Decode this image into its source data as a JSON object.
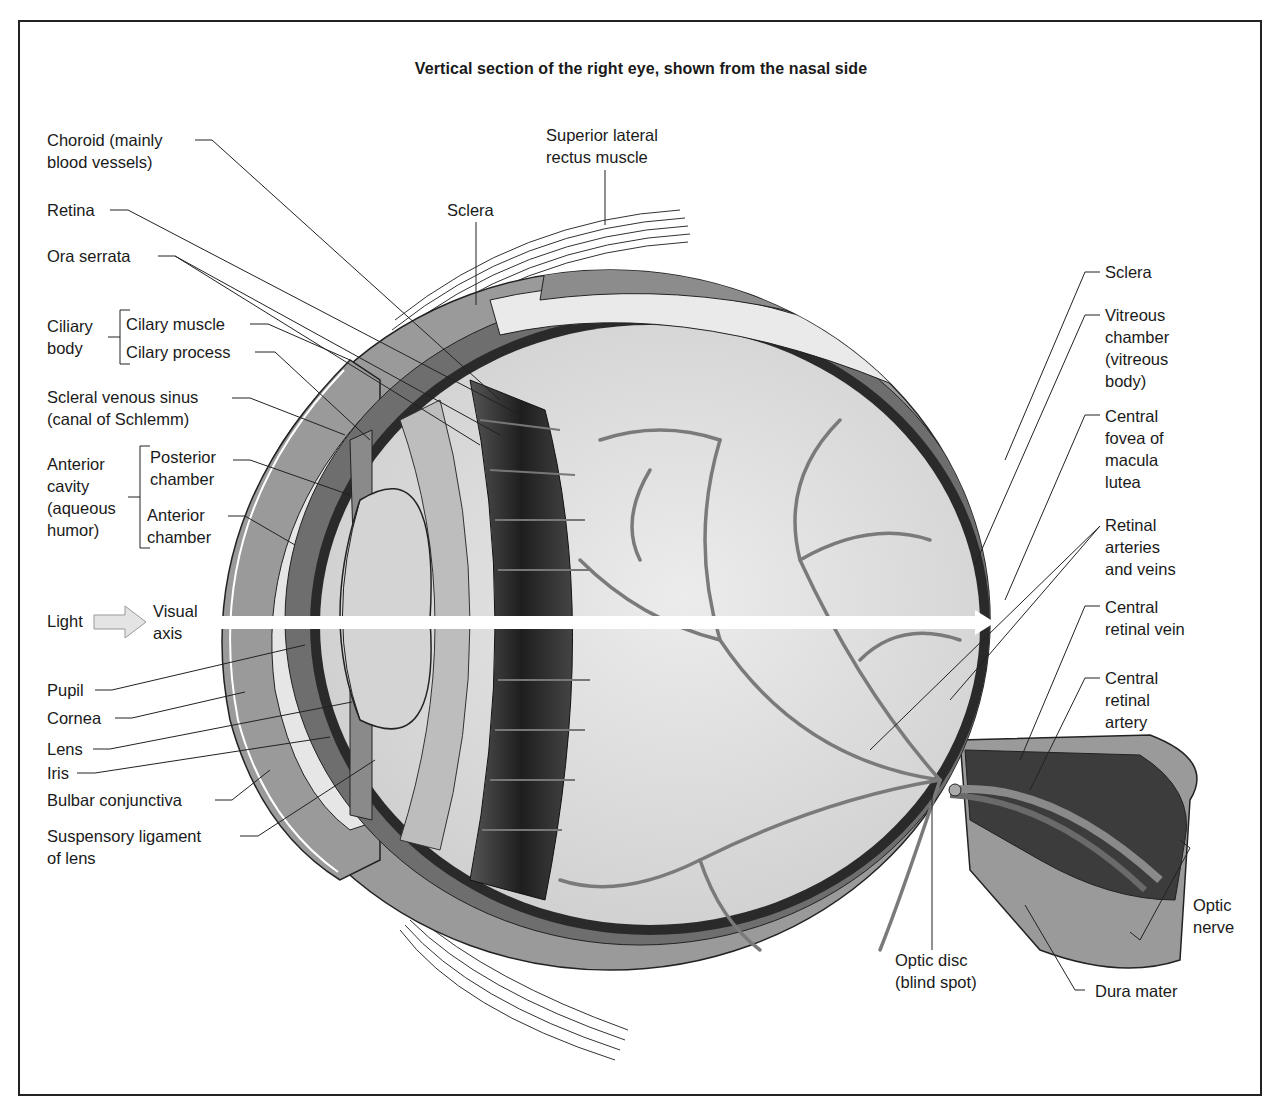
{
  "title": "Vertical section of the right eye, shown from the nasal side",
  "labels": {
    "choroid": "Choroid (mainly\nblood vessels)",
    "retina": "Retina",
    "ora_serrata": "Ora serrata",
    "ciliary_body": "Ciliary\nbody",
    "ciliary_muscle": "Cilary muscle",
    "ciliary_process": "Cilary process",
    "scleral_venous_sinus": "Scleral venous sinus\n(canal of Schlemm)",
    "anterior_cavity": "Anterior\ncavity\n(aqueous\nhumor)",
    "posterior_chamber": "Posterior\nchamber",
    "anterior_chamber": "Anterior\nchamber",
    "light": "Light",
    "visual_axis": "Visual\naxis",
    "pupil": "Pupil",
    "cornea": "Cornea",
    "lens": "Lens",
    "iris": "Iris",
    "bulbar_conjunctiva": "Bulbar conjunctiva",
    "suspensory_ligament": "Suspensory ligament\nof lens",
    "superior_lateral_rectus": "Superior lateral\nrectus muscle",
    "sclera_top": "Sclera",
    "sclera_right": "Sclera",
    "vitreous_chamber": "Vitreous\nchamber\n(vitreous\nbody)",
    "central_fovea": "Central\nfovea of\nmacula\nlutea",
    "retinal_vessels": "Retinal\narteries\nand veins",
    "central_retinal_vein": "Central\nretinal vein",
    "central_retinal_artery": "Central\nretinal\nartery",
    "optic_disc": "Optic disc\n(blind spot)",
    "optic_nerve": "Optic\nnerve",
    "dura_mater": "Dura mater"
  },
  "colors": {
    "sclera": "#9a9a9a",
    "choroid": "#6e6e6e",
    "retina_dark": "#2a2a2a",
    "vitreous": "#dcdcdc",
    "vessel": "#7a7a7a",
    "aqueous": "#e6e6e6",
    "lens": "#d4d4d4",
    "visual_axis": "#ffffff"
  }
}
